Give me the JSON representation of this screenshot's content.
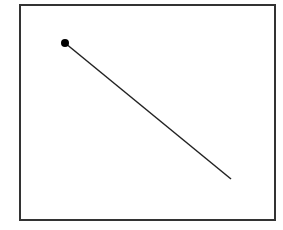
{
  "diagram": {
    "background": "#ffffff",
    "frame": {
      "x": 20,
      "y": 5,
      "width": 255,
      "height": 215,
      "stroke": "#333333",
      "stroke_width": 2
    },
    "segment": {
      "x1": 65,
      "y1": 43,
      "x2": 231,
      "y2": 179,
      "stroke": "#222222",
      "stroke_width": 1.5
    },
    "endpoint_dot": {
      "cx": 65,
      "cy": 43,
      "r": 4,
      "fill": "#000000"
    }
  }
}
